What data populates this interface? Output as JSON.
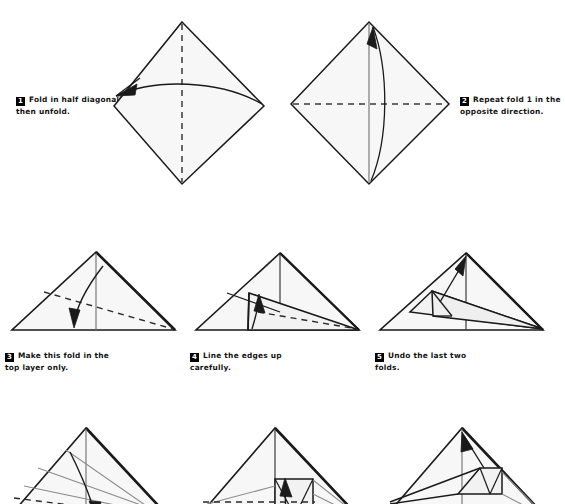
{
  "document": {
    "kind": "origami-folding-instructions",
    "paper_fill": "#f7f7f7",
    "line_color": "#1a1a1a",
    "crease_color": "#8c8c8c",
    "badge_bg": "#000000",
    "badge_fg": "#ffffff",
    "background": "#ffffff"
  },
  "steps": [
    {
      "number": "1",
      "text": "Fold in half diagonally, then unfold.",
      "shape": "diamond",
      "fold_line": "vertical-dashed",
      "arrow": "curved-left-pointing"
    },
    {
      "number": "2",
      "text": "Repeat fold 1 in the opposite direction.",
      "shape": "diamond",
      "fold_line": "horizontal-dashed",
      "arrow": "curved-up-pointing"
    },
    {
      "number": "3",
      "text": "Make this fold in the top layer only.",
      "shape": "triangle",
      "fold_line": "diagonal-dashed",
      "arrow": "curved-down-pointing"
    },
    {
      "number": "4",
      "text": "Line the edges up carefully.",
      "shape": "triangle-folded",
      "fold_line": "diagonal-dashed",
      "arrow": "curved-up-pointing"
    },
    {
      "number": "5",
      "text": "Undo the last two folds.",
      "shape": "triangle-folded-flap",
      "fold_line": "none",
      "arrow": "straight-up-left-pointing"
    },
    {
      "number": "6",
      "text": "",
      "shape": "triangle-creased",
      "fold_line": "diagonal-dashed",
      "arrow": "curved-down-pointing"
    },
    {
      "number": "7",
      "text": "",
      "shape": "triangle-creased-flap",
      "fold_line": "horizontal-dashed",
      "arrow": "curved-up-pointing"
    },
    {
      "number": "8",
      "text": "",
      "shape": "triangle-box-flap",
      "fold_line": "none",
      "arrow": "straight-up-pointing"
    }
  ]
}
